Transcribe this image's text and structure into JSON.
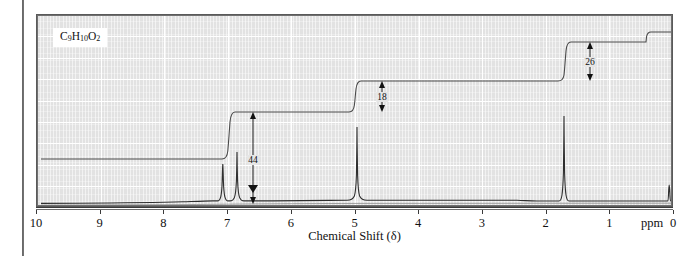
{
  "figure": {
    "compound_formula": "C9H10O2",
    "formula_parts": [
      {
        "el": "C",
        "sub": "9"
      },
      {
        "el": "H",
        "sub": "10"
      },
      {
        "el": "O",
        "sub": "2"
      }
    ],
    "axis_title": "Chemical Shift (δ)",
    "unit_label": "ppm",
    "frame_color": "#5a5a5a",
    "grid_color": "#ffffff",
    "background_color": "#e2e2e2",
    "trace_color": "#3a3a3a"
  },
  "chart_data": {
    "type": "line",
    "title": "",
    "subtitle": "",
    "xlabel": "Chemical Shift (δ)",
    "ylabel": "",
    "xlim": [
      10,
      0
    ],
    "ylim": [
      0,
      100
    ],
    "x_unit": "ppm",
    "grid": true,
    "legend": "none",
    "x_axis_reversed": true,
    "x_ticks": [
      10,
      9,
      8,
      7,
      6,
      5,
      4,
      3,
      2,
      1,
      0
    ],
    "x_tick_labels": [
      "10",
      "9",
      "8",
      "7",
      "6",
      "5",
      "4",
      "3",
      "2",
      "1",
      "0"
    ],
    "annotations": [
      {
        "text": "C9H10O2",
        "x": 9.55,
        "y": 92,
        "kind": "formula-label"
      }
    ],
    "series": [
      {
        "name": "1H NMR spectrum",
        "kind": "spectrum",
        "peaks": [
          {
            "shift_ppm": 7.33,
            "height": 52,
            "width_ppm": 0.11,
            "assignment": "aromatic multiplet"
          },
          {
            "shift_ppm": 7.27,
            "height": 40,
            "width_ppm": 0.09,
            "assignment": "aromatic multiplet"
          },
          {
            "shift_ppm": 5.08,
            "height": 86,
            "width_ppm": 0.045,
            "assignment": "OCH2 singlet"
          },
          {
            "shift_ppm": 2.05,
            "height": 94,
            "width_ppm": 0.045,
            "assignment": "CH3 singlet"
          },
          {
            "shift_ppm": 0.0,
            "height": 14,
            "width_ppm": 0.035,
            "assignment": "TMS reference"
          }
        ]
      },
      {
        "name": "Integration trace",
        "kind": "integral",
        "steps": [
          {
            "shift_ppm": 7.3,
            "value": 44,
            "label": "44"
          },
          {
            "shift_ppm": 5.08,
            "value": 18,
            "label": "18"
          },
          {
            "shift_ppm": 2.05,
            "value": 26,
            "label": "26"
          }
        ]
      }
    ]
  }
}
